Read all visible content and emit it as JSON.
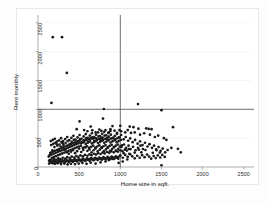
{
  "figure": {
    "background_color": "#ffffff",
    "frame_color": "#e8e8e8",
    "marker_color": "#1a1a1a",
    "refline_color": "#4a4a4a",
    "gridline_color": "#f0f0f0"
  },
  "chart_data": {
    "type": "scatter",
    "title": "",
    "xlabel": "Home size in sqft.",
    "ylabel": "Rent monthly",
    "xlim": [
      0,
      2600
    ],
    "ylim": [
      0,
      2600
    ],
    "xticks": [
      0,
      500,
      1000,
      1500,
      2000,
      2500
    ],
    "xtick_labels": [
      "0",
      "500",
      "1000",
      "1500",
      "2000",
      "2500"
    ],
    "yticks": [
      0,
      500,
      1000,
      1500,
      2000,
      2500
    ],
    "ytick_labels": [
      "0",
      "500",
      "1000",
      "1500",
      "2000",
      "2500"
    ],
    "grid": true,
    "legend": "none",
    "reference_lines": [
      {
        "orientation": "vertical",
        "value": 1000,
        "label": "vertical reference line at 1000 sqft"
      },
      {
        "orientation": "horizontal",
        "value": 1000,
        "label": "horizontal reference line at 1000 rent"
      }
    ],
    "marker": {
      "shape": "circle",
      "size": 2.0,
      "color": "#1a1a1a"
    },
    "n_points": 430,
    "points": [
      [
        180,
        2250
      ],
      [
        292,
        2250
      ],
      [
        350,
        1630
      ],
      [
        163,
        1110
      ],
      [
        800,
        1005
      ],
      [
        1215,
        1090
      ],
      [
        1500,
        985
      ],
      [
        505,
        790
      ],
      [
        790,
        840
      ],
      [
        640,
        700
      ],
      [
        905,
        710
      ],
      [
        1000,
        715
      ],
      [
        1115,
        700
      ],
      [
        1160,
        690
      ],
      [
        1220,
        665
      ],
      [
        1315,
        670
      ],
      [
        1345,
        660
      ],
      [
        1380,
        655
      ],
      [
        1640,
        690
      ],
      [
        470,
        655
      ],
      [
        560,
        640
      ],
      [
        600,
        620
      ],
      [
        660,
        635
      ],
      [
        700,
        600
      ],
      [
        745,
        650
      ],
      [
        770,
        625
      ],
      [
        820,
        640
      ],
      [
        860,
        600
      ],
      [
        880,
        655
      ],
      [
        930,
        630
      ],
      [
        960,
        590
      ],
      [
        990,
        640
      ],
      [
        1010,
        620
      ],
      [
        1060,
        600
      ],
      [
        1090,
        640
      ],
      [
        1130,
        590
      ],
      [
        1175,
        600
      ],
      [
        1240,
        560
      ],
      [
        1290,
        585
      ],
      [
        1360,
        560
      ],
      [
        1420,
        520
      ],
      [
        1460,
        545
      ],
      [
        1530,
        500
      ],
      [
        1560,
        470
      ],
      [
        1620,
        330
      ],
      [
        1700,
        315
      ],
      [
        1735,
        255
      ],
      [
        1225,
        300
      ],
      [
        1305,
        295
      ],
      [
        1395,
        245
      ],
      [
        1440,
        290
      ],
      [
        1480,
        250
      ],
      [
        1500,
        30
      ],
      [
        1255,
        255
      ],
      [
        1175,
        250
      ],
      [
        1110,
        230
      ],
      [
        1040,
        240
      ],
      [
        980,
        70
      ],
      [
        1030,
        95
      ],
      [
        1085,
        130
      ],
      [
        905,
        140
      ],
      [
        860,
        120
      ],
      [
        820,
        95
      ],
      [
        760,
        80
      ],
      [
        700,
        60
      ],
      [
        640,
        75
      ],
      [
        590,
        55
      ],
      [
        540,
        70
      ],
      [
        495,
        60
      ],
      [
        450,
        50
      ],
      [
        400,
        55
      ],
      [
        360,
        45
      ],
      [
        320,
        60
      ],
      [
        280,
        50
      ],
      [
        240,
        65
      ],
      [
        205,
        55
      ],
      [
        175,
        70
      ],
      [
        150,
        90
      ],
      [
        135,
        110
      ],
      [
        160,
        130
      ],
      [
        190,
        140
      ],
      [
        215,
        125
      ],
      [
        245,
        150
      ],
      [
        270,
        135
      ],
      [
        300,
        160
      ],
      [
        330,
        145
      ],
      [
        355,
        170
      ],
      [
        385,
        155
      ],
      [
        410,
        180
      ],
      [
        440,
        165
      ],
      [
        465,
        190
      ],
      [
        490,
        175
      ],
      [
        515,
        200
      ],
      [
        545,
        185
      ],
      [
        570,
        210
      ],
      [
        600,
        195
      ],
      [
        625,
        220
      ],
      [
        650,
        205
      ],
      [
        680,
        230
      ],
      [
        705,
        215
      ],
      [
        730,
        240
      ],
      [
        760,
        225
      ],
      [
        785,
        250
      ],
      [
        810,
        235
      ],
      [
        840,
        260
      ],
      [
        865,
        245
      ],
      [
        890,
        270
      ],
      [
        920,
        255
      ],
      [
        945,
        280
      ],
      [
        970,
        265
      ],
      [
        1000,
        290
      ],
      [
        1025,
        275
      ],
      [
        1055,
        300
      ],
      [
        1080,
        285
      ],
      [
        1105,
        310
      ],
      [
        140,
        200
      ],
      [
        165,
        215
      ],
      [
        190,
        230
      ],
      [
        215,
        245
      ],
      [
        240,
        260
      ],
      [
        265,
        275
      ],
      [
        290,
        290
      ],
      [
        315,
        305
      ],
      [
        340,
        320
      ],
      [
        365,
        335
      ],
      [
        390,
        350
      ],
      [
        415,
        365
      ],
      [
        440,
        380
      ],
      [
        465,
        395
      ],
      [
        490,
        410
      ],
      [
        515,
        425
      ],
      [
        540,
        440
      ],
      [
        565,
        455
      ],
      [
        590,
        470
      ],
      [
        615,
        485
      ],
      [
        640,
        500
      ],
      [
        665,
        490
      ],
      [
        690,
        505
      ],
      [
        715,
        470
      ],
      [
        740,
        485
      ],
      [
        765,
        500
      ],
      [
        790,
        470
      ],
      [
        815,
        490
      ],
      [
        840,
        505
      ],
      [
        865,
        475
      ],
      [
        890,
        495
      ],
      [
        915,
        510
      ],
      [
        940,
        480
      ],
      [
        965,
        500
      ],
      [
        990,
        515
      ],
      [
        155,
        250
      ],
      [
        180,
        265
      ],
      [
        205,
        280
      ],
      [
        230,
        295
      ],
      [
        255,
        310
      ],
      [
        280,
        325
      ],
      [
        305,
        340
      ],
      [
        330,
        355
      ],
      [
        355,
        370
      ],
      [
        380,
        385
      ],
      [
        405,
        400
      ],
      [
        430,
        415
      ],
      [
        455,
        430
      ],
      [
        480,
        445
      ],
      [
        505,
        460
      ],
      [
        530,
        415
      ],
      [
        555,
        430
      ],
      [
        580,
        400
      ],
      [
        605,
        420
      ],
      [
        630,
        440
      ],
      [
        655,
        410
      ],
      [
        680,
        430
      ],
      [
        705,
        450
      ],
      [
        730,
        415
      ],
      [
        755,
        435
      ],
      [
        780,
        455
      ],
      [
        805,
        420
      ],
      [
        830,
        440
      ],
      [
        855,
        460
      ],
      [
        880,
        425
      ],
      [
        905,
        445
      ],
      [
        930,
        465
      ],
      [
        955,
        430
      ],
      [
        980,
        450
      ],
      [
        1005,
        470
      ],
      [
        170,
        160
      ],
      [
        195,
        175
      ],
      [
        220,
        190
      ],
      [
        245,
        205
      ],
      [
        270,
        220
      ],
      [
        295,
        235
      ],
      [
        320,
        250
      ],
      [
        345,
        265
      ],
      [
        370,
        280
      ],
      [
        395,
        295
      ],
      [
        420,
        310
      ],
      [
        445,
        325
      ],
      [
        470,
        340
      ],
      [
        495,
        355
      ],
      [
        520,
        370
      ],
      [
        545,
        330
      ],
      [
        570,
        345
      ],
      [
        595,
        360
      ],
      [
        620,
        330
      ],
      [
        645,
        350
      ],
      [
        670,
        370
      ],
      [
        695,
        335
      ],
      [
        720,
        355
      ],
      [
        745,
        375
      ],
      [
        770,
        340
      ],
      [
        795,
        360
      ],
      [
        820,
        380
      ],
      [
        845,
        345
      ],
      [
        870,
        365
      ],
      [
        895,
        385
      ],
      [
        920,
        350
      ],
      [
        945,
        370
      ],
      [
        970,
        390
      ],
      [
        995,
        355
      ],
      [
        1020,
        375
      ],
      [
        130,
        180
      ],
      [
        150,
        235
      ],
      [
        175,
        290
      ],
      [
        200,
        345
      ],
      [
        225,
        400
      ],
      [
        250,
        300
      ],
      [
        275,
        355
      ],
      [
        300,
        410
      ],
      [
        325,
        300
      ],
      [
        350,
        255
      ],
      [
        375,
        230
      ],
      [
        400,
        265
      ],
      [
        425,
        290
      ],
      [
        450,
        240
      ],
      [
        475,
        275
      ],
      [
        500,
        320
      ],
      [
        525,
        260
      ],
      [
        550,
        295
      ],
      [
        575,
        340
      ],
      [
        600,
        280
      ],
      [
        625,
        305
      ],
      [
        650,
        255
      ],
      [
        675,
        290
      ],
      [
        700,
        320
      ],
      [
        725,
        270
      ],
      [
        750,
        300
      ],
      [
        775,
        330
      ],
      [
        800,
        275
      ],
      [
        825,
        305
      ],
      [
        850,
        335
      ],
      [
        875,
        280
      ],
      [
        900,
        310
      ],
      [
        925,
        340
      ],
      [
        950,
        285
      ],
      [
        975,
        315
      ],
      [
        145,
        120
      ],
      [
        170,
        100
      ],
      [
        195,
        110
      ],
      [
        220,
        95
      ],
      [
        245,
        115
      ],
      [
        270,
        100
      ],
      [
        295,
        120
      ],
      [
        320,
        105
      ],
      [
        345,
        125
      ],
      [
        370,
        110
      ],
      [
        395,
        130
      ],
      [
        420,
        115
      ],
      [
        445,
        135
      ],
      [
        470,
        120
      ],
      [
        495,
        140
      ],
      [
        520,
        125
      ],
      [
        545,
        145
      ],
      [
        570,
        130
      ],
      [
        595,
        150
      ],
      [
        620,
        135
      ],
      [
        645,
        155
      ],
      [
        670,
        140
      ],
      [
        695,
        160
      ],
      [
        720,
        145
      ],
      [
        745,
        165
      ],
      [
        770,
        150
      ],
      [
        795,
        170
      ],
      [
        820,
        155
      ],
      [
        845,
        175
      ],
      [
        870,
        160
      ],
      [
        895,
        180
      ],
      [
        920,
        165
      ],
      [
        945,
        185
      ],
      [
        970,
        170
      ],
      [
        995,
        190
      ],
      [
        160,
        380
      ],
      [
        185,
        400
      ],
      [
        210,
        420
      ],
      [
        235,
        370
      ],
      [
        260,
        390
      ],
      [
        285,
        430
      ],
      [
        310,
        380
      ],
      [
        335,
        415
      ],
      [
        360,
        450
      ],
      [
        385,
        395
      ],
      [
        410,
        435
      ],
      [
        435,
        470
      ],
      [
        460,
        405
      ],
      [
        485,
        445
      ],
      [
        510,
        485
      ],
      [
        535,
        420
      ],
      [
        560,
        465
      ],
      [
        585,
        500
      ],
      [
        610,
        440
      ],
      [
        635,
        475
      ],
      [
        660,
        515
      ],
      [
        685,
        455
      ],
      [
        710,
        495
      ],
      [
        735,
        530
      ],
      [
        760,
        470
      ],
      [
        785,
        510
      ],
      [
        810,
        545
      ],
      [
        835,
        485
      ],
      [
        860,
        525
      ],
      [
        885,
        560
      ],
      [
        910,
        500
      ],
      [
        935,
        540
      ],
      [
        960,
        575
      ],
      [
        985,
        515
      ],
      [
        1010,
        555
      ],
      [
        1040,
        480
      ],
      [
        1065,
        520
      ],
      [
        1095,
        455
      ],
      [
        1120,
        495
      ],
      [
        1150,
        430
      ],
      [
        1180,
        470
      ],
      [
        1210,
        405
      ],
      [
        1240,
        445
      ],
      [
        1270,
        380
      ],
      [
        1300,
        420
      ],
      [
        1330,
        355
      ],
      [
        1355,
        395
      ],
      [
        1385,
        330
      ],
      [
        1410,
        370
      ],
      [
        1435,
        305
      ],
      [
        1465,
        345
      ],
      [
        1490,
        280
      ],
      [
        1515,
        320
      ],
      [
        1545,
        255
      ],
      [
        1575,
        295
      ],
      [
        155,
        450
      ],
      [
        180,
        470
      ],
      [
        205,
        490
      ],
      [
        230,
        440
      ],
      [
        255,
        460
      ],
      [
        280,
        500
      ],
      [
        305,
        450
      ],
      [
        330,
        485
      ],
      [
        355,
        520
      ],
      [
        380,
        465
      ],
      [
        405,
        505
      ],
      [
        430,
        540
      ],
      [
        455,
        475
      ],
      [
        480,
        515
      ],
      [
        505,
        555
      ],
      [
        530,
        490
      ],
      [
        555,
        530
      ],
      [
        580,
        570
      ],
      [
        605,
        505
      ],
      [
        630,
        545
      ],
      [
        655,
        585
      ],
      [
        680,
        520
      ],
      [
        705,
        560
      ],
      [
        730,
        600
      ],
      [
        755,
        535
      ],
      [
        780,
        575
      ],
      [
        805,
        610
      ],
      [
        830,
        550
      ],
      [
        855,
        590
      ],
      [
        880,
        625
      ],
      [
        135,
        60
      ],
      [
        155,
        80
      ],
      [
        178,
        65
      ],
      [
        200,
        85
      ],
      [
        225,
        70
      ],
      [
        250,
        90
      ],
      [
        275,
        75
      ],
      [
        300,
        95
      ],
      [
        325,
        80
      ],
      [
        350,
        100
      ],
      [
        375,
        85
      ],
      [
        400,
        105
      ],
      [
        425,
        90
      ],
      [
        450,
        110
      ],
      [
        475,
        95
      ],
      [
        500,
        115
      ],
      [
        525,
        100
      ],
      [
        550,
        120
      ],
      [
        575,
        105
      ],
      [
        600,
        125
      ],
      [
        625,
        110
      ],
      [
        650,
        130
      ],
      [
        675,
        115
      ],
      [
        700,
        135
      ],
      [
        725,
        120
      ],
      [
        750,
        140
      ],
      [
        775,
        125
      ],
      [
        800,
        145
      ],
      [
        825,
        130
      ],
      [
        850,
        150
      ],
      [
        875,
        135
      ],
      [
        900,
        155
      ],
      [
        925,
        140
      ],
      [
        950,
        160
      ],
      [
        975,
        145
      ],
      [
        1015,
        350
      ],
      [
        1045,
        390
      ],
      [
        1070,
        330
      ],
      [
        1100,
        370
      ],
      [
        1125,
        310
      ],
      [
        1155,
        350
      ],
      [
        1185,
        290
      ],
      [
        1215,
        330
      ],
      [
        1245,
        370
      ],
      [
        1275,
        310
      ],
      [
        1000,
        200
      ],
      [
        1030,
        160
      ],
      [
        1060,
        210
      ],
      [
        1090,
        175
      ],
      [
        1120,
        220
      ],
      [
        1145,
        185
      ],
      [
        1175,
        150
      ],
      [
        1205,
        195
      ],
      [
        1235,
        160
      ],
      [
        1265,
        205
      ],
      [
        1295,
        170
      ],
      [
        1325,
        215
      ],
      [
        1350,
        180
      ],
      [
        1375,
        145
      ],
      [
        1405,
        190
      ],
      [
        1430,
        155
      ],
      [
        1455,
        200
      ],
      [
        1485,
        165
      ],
      [
        1510,
        210
      ],
      [
        1540,
        175
      ]
    ]
  }
}
